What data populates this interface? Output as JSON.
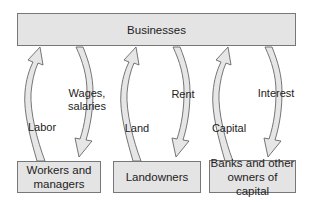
{
  "diagram": {
    "title_box": {
      "label": "Businesses"
    },
    "bottom_boxes": [
      {
        "label_line1": "Workers and",
        "label_line2": "managers"
      },
      {
        "label_line1": "Landowners",
        "label_line2": ""
      },
      {
        "label_line1": "Banks and other",
        "label_line2": "owners of capital"
      }
    ],
    "flows": [
      {
        "direction": "up",
        "label": "Labor",
        "from": "Workers and managers",
        "to": "Businesses"
      },
      {
        "direction": "down",
        "label_line1": "Wages,",
        "label_line2": "salaries",
        "from": "Businesses",
        "to": "Workers and managers"
      },
      {
        "direction": "up",
        "label": "Land",
        "from": "Landowners",
        "to": "Businesses"
      },
      {
        "direction": "down",
        "label": "Rent",
        "from": "Businesses",
        "to": "Landowners"
      },
      {
        "direction": "up",
        "label": "Capital",
        "from": "Banks and other owners of capital",
        "to": "Businesses"
      },
      {
        "direction": "down",
        "label": "Interest",
        "from": "Businesses",
        "to": "Banks and other owners of capital"
      }
    ],
    "colors": {
      "box_fill": "#e4e4e4",
      "box_border": "#777777",
      "arrow_fill": "#e6e6e6",
      "arrow_stroke": "#666666",
      "text": "#222222"
    }
  }
}
